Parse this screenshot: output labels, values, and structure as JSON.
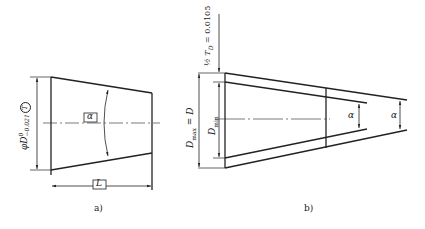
{
  "figure_a": {
    "caption": "a)",
    "dim_diameter": "φD",
    "tol_upper": "0",
    "tol_lower": "−0.021",
    "circled_symbol": "T",
    "angle_label": "α",
    "length_label": "L"
  },
  "figure_b": {
    "caption": "b)",
    "half_tolerance": "½ T",
    "half_tolerance_sub": "D",
    "half_tolerance_value": " = 0.0105",
    "dmax_label": "D",
    "dmax_sub": "max",
    "dmax_eq": " = D",
    "dmin_label": "D",
    "dmin_sub": "min",
    "angle_label_1": "α",
    "angle_label_2": "α"
  }
}
